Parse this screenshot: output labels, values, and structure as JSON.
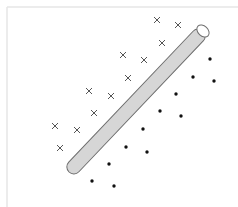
{
  "diagram": {
    "title": "",
    "colors": {
      "background": "#ffffff",
      "frame": "#e6e6e6",
      "cylinder_fill": "#d6d6d6",
      "cylinder_stroke": "#6e6e6e",
      "cap_fill": "#ffffff",
      "cross": "#555555",
      "dot": "#111111"
    },
    "class_crosses": {
      "marker": "cross",
      "points": [
        [
          157,
          20
        ],
        [
          178,
          25
        ],
        [
          162,
          43
        ],
        [
          123,
          55
        ],
        [
          144,
          60
        ],
        [
          128,
          78
        ],
        [
          89,
          91
        ],
        [
          111,
          96
        ],
        [
          94,
          113
        ],
        [
          55,
          126
        ],
        [
          77,
          130
        ],
        [
          60,
          148
        ]
      ]
    },
    "class_dots": {
      "marker": "dot",
      "points": [
        [
          210,
          59
        ],
        [
          193,
          77
        ],
        [
          214,
          81
        ],
        [
          176,
          94
        ],
        [
          160,
          111
        ],
        [
          181,
          116
        ],
        [
          143,
          129
        ],
        [
          126,
          147
        ],
        [
          147,
          152
        ],
        [
          109,
          164
        ],
        [
          92,
          181
        ],
        [
          114,
          186
        ]
      ]
    },
    "separator": {
      "shape": "cylinder",
      "from": [
        69,
        172
      ],
      "to": [
        203,
        31
      ]
    }
  }
}
